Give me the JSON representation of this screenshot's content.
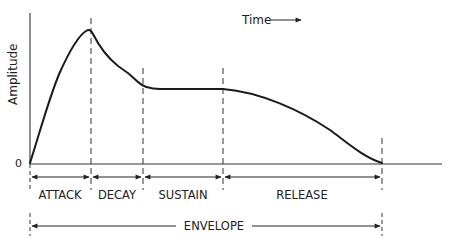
{
  "diagram": {
    "y_axis_label": "Amplitude",
    "zero_label": "0",
    "time_label": "Time",
    "segments": [
      {
        "label": "ATTACK",
        "x_start": 30,
        "x_end": 91
      },
      {
        "label": "DECAY",
        "x_start": 91,
        "x_end": 143
      },
      {
        "label": "SUSTAIN",
        "x_start": 143,
        "x_end": 223
      },
      {
        "label": "RELEASE",
        "x_start": 223,
        "x_end": 382
      }
    ],
    "envelope_label": "ENVELOPE",
    "colors": {
      "line": "#1a1a1a",
      "background": "#ffffff"
    }
  }
}
